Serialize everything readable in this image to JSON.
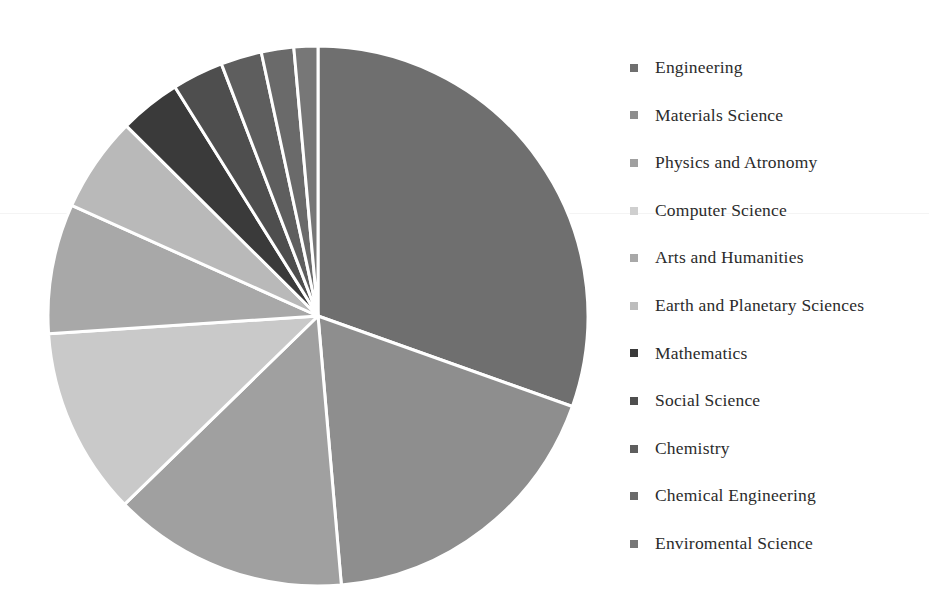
{
  "chart_data": {
    "type": "pie",
    "title": "",
    "subtitle": "",
    "xlabel": "",
    "ylabel": "",
    "grid": false,
    "legend_position": "right",
    "start_angle_deg": 0,
    "direction": "clockwise",
    "center": [
      318,
      316
    ],
    "radius": 270,
    "separator_color": "#ffffff",
    "separator_width": 3,
    "background": "#ffffff",
    "categories": [
      "Engineering",
      "Materials Science",
      "Physics and Atronomy",
      "Computer Science",
      "Arts and Humanities",
      "Earth and Planetary Sciences",
      "Mathematics",
      "Social Science",
      "Chemistry",
      "Chemical Engineering",
      "Enviromental Science"
    ],
    "values": [
      29.8,
      17.8,
      13.8,
      11.0,
      7.6,
      5.6,
      3.6,
      3.0,
      2.4,
      1.9,
      1.4
    ],
    "colors": [
      "#6f6f6f",
      "#8e8e8e",
      "#a0a0a0",
      "#c9c9c9",
      "#a8a8a8",
      "#b9b9b9",
      "#3a3a3a",
      "#4e4e4e",
      "#5e5e5e",
      "#6a6a6a",
      "#777777"
    ],
    "legend_marker_colors": [
      "#6f6f6f",
      "#8e8e8e",
      "#a0a0a0",
      "#cfcfcf",
      "#a8a8a8",
      "#bdbdbd",
      "#3a3a3a",
      "#4e4e4e",
      "#5e5e5e",
      "#6a6a6a",
      "#777777"
    ]
  },
  "legend": {
    "items": [
      {
        "label": "Engineering"
      },
      {
        "label": "Materials Science"
      },
      {
        "label": "Physics and Atronomy"
      },
      {
        "label": "Computer Science"
      },
      {
        "label": "Arts and Humanities"
      },
      {
        "label": "Earth and Planetary Sciences"
      },
      {
        "label": "Mathematics"
      },
      {
        "label": "Social Science"
      },
      {
        "label": "Chemistry"
      },
      {
        "label": "Chemical Engineering"
      },
      {
        "label": "Enviromental Science"
      }
    ]
  }
}
